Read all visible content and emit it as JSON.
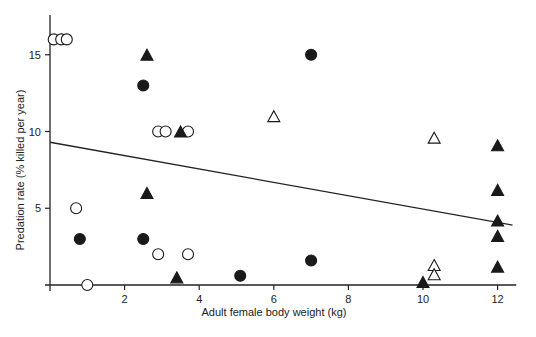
{
  "chart_data": {
    "type": "scatter",
    "title": "",
    "xlabel": "Adult female body weight (kg)",
    "ylabel": "Predation rate (% killed per year)",
    "xlim": [
      0,
      12.5
    ],
    "ylim": [
      0,
      17
    ],
    "x_ticks": [
      2,
      4,
      6,
      8,
      10,
      12
    ],
    "y_ticks": [
      5,
      10,
      15
    ],
    "grid": false,
    "legend": null,
    "series": [
      {
        "name": "open-circle",
        "marker": "circle",
        "filled": false,
        "points": [
          [
            0.1,
            16
          ],
          [
            0.3,
            16
          ],
          [
            0.45,
            16
          ],
          [
            2.9,
            10
          ],
          [
            3.1,
            10
          ],
          [
            3.7,
            10
          ],
          [
            0.7,
            5
          ],
          [
            2.9,
            2
          ],
          [
            3.7,
            2
          ],
          [
            1.0,
            0
          ]
        ]
      },
      {
        "name": "filled-circle",
        "marker": "circle",
        "filled": true,
        "points": [
          [
            2.5,
            13
          ],
          [
            7.0,
            15
          ],
          [
            0.8,
            3
          ],
          [
            2.5,
            3
          ],
          [
            5.1,
            0.6
          ],
          [
            7.0,
            1.6
          ]
        ]
      },
      {
        "name": "open-triangle",
        "marker": "triangle",
        "filled": false,
        "points": [
          [
            6.0,
            11
          ],
          [
            10.3,
            9.6
          ],
          [
            10.3,
            1.3
          ],
          [
            10.3,
            0.7
          ]
        ]
      },
      {
        "name": "filled-triangle",
        "marker": "triangle",
        "filled": true,
        "points": [
          [
            2.6,
            15
          ],
          [
            3.5,
            10
          ],
          [
            2.6,
            6
          ],
          [
            3.4,
            0.5
          ],
          [
            10.0,
            0.2
          ],
          [
            12.0,
            9.1
          ],
          [
            12.0,
            6.2
          ],
          [
            12.0,
            4.2
          ],
          [
            12.0,
            3.2
          ],
          [
            12.0,
            1.2
          ]
        ]
      }
    ],
    "regression_line": {
      "x": [
        0,
        12.4
      ],
      "y": [
        9.3,
        3.9
      ]
    }
  },
  "layout": {
    "x0_px": 50,
    "x_px_per_unit": 37.3,
    "y0_px": 285,
    "y_px_per_unit": 15.35
  }
}
